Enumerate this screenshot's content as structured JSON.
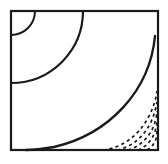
{
  "figure": {
    "title": "Geometric diagram of concentric arcs with dashed hyperbolic curves",
    "canvas": {
      "width": 168,
      "height": 164,
      "background": "#ffffff"
    },
    "stroke_color": "#1a1a1a",
    "frame": {
      "label": "Rectangular border frame",
      "x": 11,
      "y": 11,
      "width": 147,
      "height": 139,
      "stroke_width": 2.2,
      "fill": "#ffffff"
    },
    "solid_arcs": [
      {
        "label": "Small quarter arc at top-left corner",
        "center_x": 11,
        "center_y": 11,
        "radius": 24,
        "stroke_width": 2.0,
        "path": "M 35 11 A 24 24 0 0 1 11 35"
      },
      {
        "label": "Medium quarter arc at top-left corner",
        "center_x": 11,
        "center_y": 11,
        "radius": 72,
        "stroke_width": 2.2,
        "path": "M 83 11 A 72 72 0 0 1 11 83"
      },
      {
        "label": "Large sweeping arc from top-right to bottom-left",
        "stroke_width": 2.4,
        "path": "M 155 36 C 150 90 110 134 54 147 C 42 149 33 150 26 150"
      }
    ],
    "dashed_curves": {
      "label": "Family of dashed hyperbolic curves in lower-right region",
      "count": 5,
      "stroke_width": 1.7,
      "dash_pattern": "3.2 3.2",
      "curves": [
        {
          "index": 1,
          "path": "M 103 150 C 122 148 138 136 148 118 C 153 109 156 99 157 91"
        },
        {
          "index": 2,
          "path": "M 117 150 C 132 147 143 137 150 124 C 154 116 156 108 157 102"
        },
        {
          "index": 3,
          "path": "M 128 150 C 139 147 147 139 152 130 C 155 123 157 116 157 111"
        },
        {
          "index": 4,
          "path": "M 138 150 C 146 147 151 141 154 134 C 156 129 157 124 157 120"
        },
        {
          "index": 5,
          "path": "M 147 150 C 151 148 154 144 156 139 C 157 135 157 132 157 129"
        }
      ]
    }
  }
}
